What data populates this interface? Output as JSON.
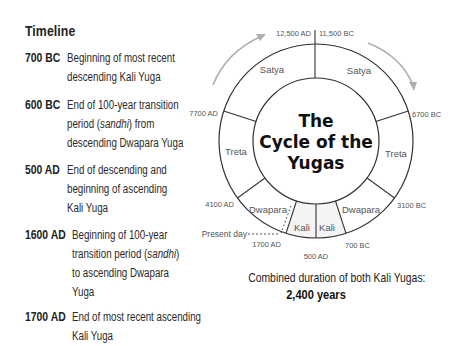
{
  "timeline": {
    "title": "Timeline",
    "entries": [
      {
        "date": "700 BC",
        "lines": [
          "Beginning of most recent",
          "descending Kali Yuga"
        ]
      },
      {
        "date": "600 BC",
        "lines": [
          "End of 100-year transition",
          "period (sandhi) from",
          "descending Dwapara Yuga"
        ]
      },
      {
        "date": "500 AD",
        "lines": [
          "End of descending and",
          "beginning of ascending",
          "Kali Yuga"
        ]
      },
      {
        "date": "1600 AD",
        "lines": [
          "Beginning of 100-year",
          "transition period (sandhi)",
          "to ascending Dwapara",
          "Yuga"
        ]
      },
      {
        "date": "1700 AD",
        "lines": [
          "End of most recent ascending",
          "Kali Yuga"
        ]
      }
    ]
  },
  "diagram": {
    "title_lines": [
      "The",
      "Cycle of the",
      "Yugas"
    ],
    "segments": {
      "left": [
        "Satya",
        "Treta",
        "Dwapara",
        "Kali"
      ],
      "right": [
        "Satya",
        "Treta",
        "Dwapara",
        "Kali"
      ]
    },
    "boundary_labels": {
      "top_left": "12,500 AD",
      "top_right": "11,500 BC",
      "left_satya_treta": "7700 AD",
      "right_satya_treta": "6700 BC",
      "left_treta_dwapara": "4100 AD",
      "right_treta_dwapara": "3100 BC",
      "left_dwapara_kali": "1700 AD",
      "right_dwapara_kali": "700 BC",
      "bottom": "500 AD"
    },
    "present_day_label": "Present day",
    "colors": {
      "line": "#333333",
      "arrow": "#b0b0b0",
      "kali_fill": "#f4f4f4"
    }
  },
  "caption": {
    "line1": "Combined duration of both Kali Yugas:",
    "line2": "2,400 years"
  }
}
